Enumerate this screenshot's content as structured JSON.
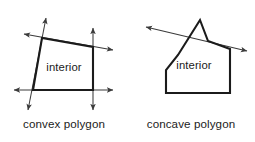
{
  "figure": {
    "title_fragment": "",
    "width": 255,
    "height": 142,
    "background": "#ffffff",
    "stroke_color": "#1b1b1b",
    "ray_color": "#3a3a3a"
  },
  "panels": [
    {
      "id": "convex",
      "caption": "convex polygon",
      "interior_label": "interior",
      "caption_x": 64,
      "caption_y": 128,
      "interior_x": 64,
      "interior_y": 71,
      "polygon_points": "42,38 93,47 93,90 33,90",
      "vertices": [
        {
          "name": "top-left",
          "x": 42,
          "y": 38
        },
        {
          "name": "top-right",
          "x": 93,
          "y": 47
        },
        {
          "name": "bottom-right",
          "x": 93,
          "y": 90
        },
        {
          "name": "bottom-left",
          "x": 33,
          "y": 90
        }
      ],
      "rays": [
        {
          "name": "top-edge-ray",
          "x1": 24,
          "y1": 34,
          "x2": 113,
          "y2": 50,
          "arrow_start": true,
          "arrow_end": true
        },
        {
          "name": "left-edge-ray",
          "x1": 46,
          "y1": 18,
          "x2": 28,
          "y2": 110,
          "arrow_start": true,
          "arrow_end": true
        },
        {
          "name": "bottom-edge-ray",
          "x1": 14,
          "y1": 90,
          "x2": 113,
          "y2": 90,
          "arrow_start": true,
          "arrow_end": true
        },
        {
          "name": "right-edge-ray",
          "x1": 93,
          "y1": 28,
          "x2": 93,
          "y2": 110,
          "arrow_start": true,
          "arrow_end": true
        }
      ]
    },
    {
      "id": "concave",
      "caption": "concave polygon",
      "interior_label": "interior",
      "caption_x": 191,
      "caption_y": 128,
      "interior_x": 194,
      "interior_y": 69,
      "polygon_points": "200,20 208,41 230,49 230,93 166,93 166,70 178,55",
      "vertices": [
        {
          "name": "spike-apex",
          "x": 200,
          "y": 20
        },
        {
          "name": "reflex-notch",
          "x": 208,
          "y": 41
        },
        {
          "name": "right-top",
          "x": 230,
          "y": 49
        },
        {
          "name": "bottom-right",
          "x": 230,
          "y": 93
        },
        {
          "name": "bottom-left",
          "x": 166,
          "y": 93
        },
        {
          "name": "left-bend",
          "x": 166,
          "y": 70
        },
        {
          "name": "upper-left",
          "x": 178,
          "y": 55
        }
      ],
      "rays": [
        {
          "name": "notch-edge-ray",
          "x1": 146,
          "y1": 27,
          "x2": 247,
          "y2": 51,
          "arrow_start": true,
          "arrow_end": true
        }
      ]
    }
  ],
  "top_clipped_text": ""
}
